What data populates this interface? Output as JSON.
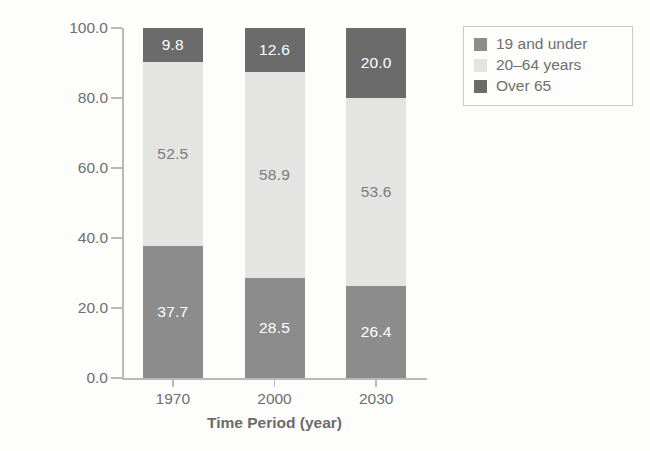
{
  "chart_data": {
    "type": "bar",
    "subtype": "stacked-bar",
    "title": "",
    "xlabel": "Time Period (year)",
    "ylabel": "Number of People (millions)",
    "categories": [
      "1970",
      "2000",
      "2030"
    ],
    "ylim": [
      0.0,
      100.0
    ],
    "yticks": [
      "0.0",
      "20.0",
      "40.0",
      "60.0",
      "80.0",
      "100.0"
    ],
    "ytick_values": [
      0.0,
      20.0,
      40.0,
      60.0,
      80.0,
      100.0
    ],
    "grid": false,
    "legend_position": "top-right",
    "stack_order_bottom_to_top": [
      "19 and under",
      "20–64 years",
      "Over 65"
    ],
    "series": [
      {
        "name": "19 and under",
        "color": "#8c8c8c",
        "values": [
          37.7,
          28.5,
          26.4
        ],
        "labels": [
          "37.7",
          "28.5",
          "26.4"
        ],
        "label_color": "#ffffff"
      },
      {
        "name": "20–64 years",
        "color": "#e4e4e2",
        "values": [
          52.5,
          58.9,
          53.6
        ],
        "labels": [
          "52.5",
          "58.9",
          "53.6"
        ],
        "label_color": "#7b7b7b"
      },
      {
        "name": "Over 65",
        "color": "#6b6b6b",
        "values": [
          9.8,
          12.6,
          20.0
        ],
        "labels": [
          "9.8",
          "12.6",
          "20.0"
        ],
        "label_color": "#ffffff"
      }
    ],
    "totals": [
      100.0,
      100.0,
      100.0
    ]
  },
  "legend": {
    "items": [
      {
        "label": "19 and under",
        "color": "#8c8c8c"
      },
      {
        "label": "20–64 years",
        "color": "#e4e4e2"
      },
      {
        "label": "Over 65",
        "color": "#6b6b6b"
      }
    ]
  },
  "colors": {
    "background": "#fdfdfb",
    "axis": "#b9b9b9",
    "text": "#6f6f6f",
    "dark_gray": "#6b6b6b",
    "mid_gray": "#8c8c8c",
    "light_gray": "#e4e4e2"
  }
}
